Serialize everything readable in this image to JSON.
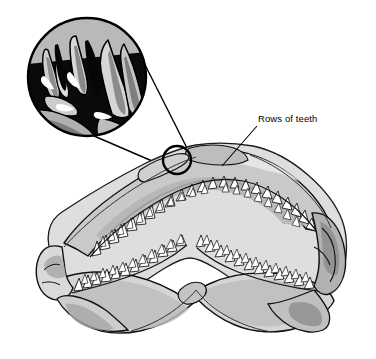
{
  "figure": {
    "background_color": "#ffffff",
    "line_color": "#000000",
    "palette": {
      "bone_light": "#e3e3e3",
      "bone_mid": "#c9c9c9",
      "bone_dark": "#a8a8a8",
      "bone_shadow": "#8f8f8f",
      "tooth_white": "#ffffff",
      "inset_black": "#000000",
      "inset_grey_light": "#d2d2d2",
      "inset_grey_mid": "#a0a0a0",
      "inset_grey_dark": "#5c5c5c"
    }
  },
  "callouts": [
    {
      "id": "rows-of-teeth",
      "label": "Rows of teeth",
      "leader_from": {
        "x": 257,
        "y": 126
      },
      "leader_to": {
        "x": 222,
        "y": 166
      }
    }
  ],
  "inset": {
    "name": "magnified-teeth-detail",
    "shape": "circle",
    "center": {
      "x": 87,
      "y": 77
    },
    "radius": 60,
    "border_color": "#000000",
    "border_width": 2.2,
    "source_marker": {
      "shape": "circle",
      "center": {
        "x": 177,
        "y": 160
      },
      "radius": 14
    },
    "connector_lines": [
      {
        "x1": 130,
        "y1": 36,
        "x2": 191,
        "y2": 157
      },
      {
        "x1": 44,
        "y1": 113,
        "x2": 167,
        "y2": 166
      }
    ]
  },
  "anatomy": {
    "upper_jaw": {
      "name": "upper-jaw-arch",
      "tooth_rows": 2,
      "teeth_per_side": 17
    },
    "lower_jaw": {
      "name": "lower-jaw-arch",
      "tooth_rows": 2,
      "teeth_per_side": 16
    },
    "hinges": [
      "left-jaw-hinge",
      "right-jaw-hinge"
    ]
  }
}
